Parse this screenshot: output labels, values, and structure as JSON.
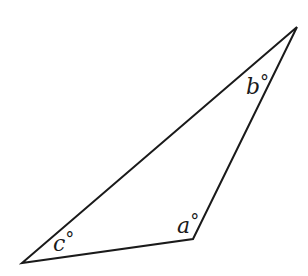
{
  "diagram": {
    "type": "triangle",
    "stroke_color": "#1a1a1a",
    "background": "#ffffff",
    "vertices": {
      "top": {
        "x": 297,
        "y": 27
      },
      "bottom": {
        "x": 193,
        "y": 239
      },
      "left": {
        "x": 22,
        "y": 263
      }
    },
    "angles": [
      {
        "id": "a",
        "vertex": "bottom",
        "variable": "a",
        "unit": "°",
        "label_x": 177,
        "label_y": 233,
        "deg_x": 193,
        "deg_y": 222
      },
      {
        "id": "b",
        "vertex": "top",
        "variable": "b",
        "unit": "°",
        "label_x": 246,
        "label_y": 94,
        "deg_x": 261,
        "deg_y": 83
      },
      {
        "id": "c",
        "vertex": "left",
        "variable": "c",
        "unit": "°",
        "label_x": 53,
        "label_y": 251,
        "deg_x": 67,
        "deg_y": 240
      }
    ]
  }
}
